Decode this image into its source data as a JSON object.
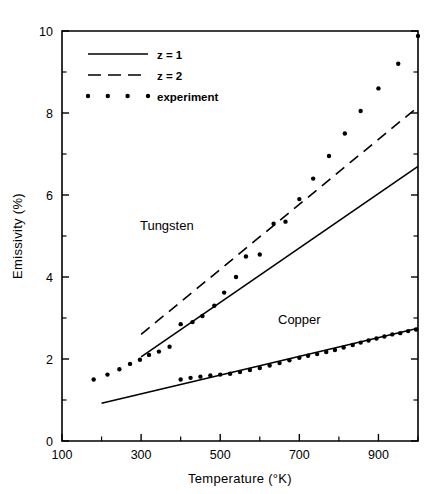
{
  "chart_data": {
    "type": "scatter",
    "title": "",
    "xlabel": "Temperature   (°K)",
    "ylabel": "Emissivity (%)",
    "xlim": [
      100,
      1000
    ],
    "ylim": [
      0,
      10
    ],
    "xticks": [
      100,
      300,
      500,
      700,
      900
    ],
    "xticks_minor": [
      200,
      400,
      600,
      800,
      1000
    ],
    "yticks": [
      0,
      2,
      4,
      6,
      8,
      10
    ],
    "yticks_minor": [
      1,
      3,
      5,
      7,
      9
    ],
    "xtick_labels": [
      "100",
      "300",
      "500",
      "700",
      "900"
    ],
    "ytick_labels": [
      "0",
      "2",
      "4",
      "6",
      "8",
      "10"
    ],
    "grid": false,
    "legend_position": "top-left",
    "legend": [
      {
        "key": "z1",
        "label": "z = 1",
        "style": "solid-line"
      },
      {
        "key": "z2",
        "label": "z = 2",
        "style": "dashed-line"
      },
      {
        "key": "experiment",
        "label": "experiment",
        "style": "dots"
      }
    ],
    "annotations": [
      {
        "text": "Tungsten",
        "x": 365,
        "y": 5.15
      },
      {
        "text": "Copper",
        "x": 700,
        "y": 2.85
      }
    ],
    "series": [
      {
        "name": "Tungsten experiment",
        "material": "Tungsten",
        "style": "dots",
        "x": [
          180,
          215,
          245,
          272,
          297,
          320,
          345,
          372,
          400,
          430,
          455,
          485,
          510,
          540,
          565,
          600,
          635,
          665,
          700,
          735,
          775,
          815,
          855,
          900,
          950,
          1000
        ],
        "y": [
          1.5,
          1.62,
          1.75,
          1.88,
          1.98,
          2.1,
          2.18,
          2.3,
          2.85,
          2.9,
          3.05,
          3.3,
          3.62,
          4.0,
          4.5,
          4.55,
          5.3,
          5.35,
          5.9,
          6.4,
          6.95,
          7.5,
          8.05,
          8.6,
          9.2,
          9.88
        ]
      },
      {
        "name": "Tungsten z = 1",
        "material": "Tungsten",
        "style": "solid-line",
        "x": [
          300,
          1000
        ],
        "y": [
          2.05,
          6.7
        ]
      },
      {
        "name": "Tungsten z = 2",
        "material": "Tungsten",
        "style": "dashed-line",
        "x": [
          300,
          1000
        ],
        "y": [
          2.6,
          8.15
        ]
      },
      {
        "name": "Copper experiment",
        "material": "Copper",
        "style": "dots",
        "x": [
          400,
          425,
          450,
          475,
          500,
          525,
          550,
          575,
          600,
          625,
          650,
          675,
          700,
          722,
          745,
          768,
          790,
          812,
          835,
          855,
          875,
          895,
          915,
          935,
          955,
          975,
          995
        ],
        "y": [
          1.5,
          1.54,
          1.57,
          1.6,
          1.62,
          1.64,
          1.68,
          1.73,
          1.78,
          1.84,
          1.9,
          1.97,
          2.03,
          2.08,
          2.12,
          2.17,
          2.22,
          2.28,
          2.34,
          2.4,
          2.45,
          2.5,
          2.55,
          2.6,
          2.63,
          2.68,
          2.72
        ]
      },
      {
        "name": "Copper z = 1",
        "material": "Copper",
        "style": "solid-line",
        "x": [
          200,
          1000
        ],
        "y": [
          0.92,
          2.75
        ]
      }
    ]
  }
}
